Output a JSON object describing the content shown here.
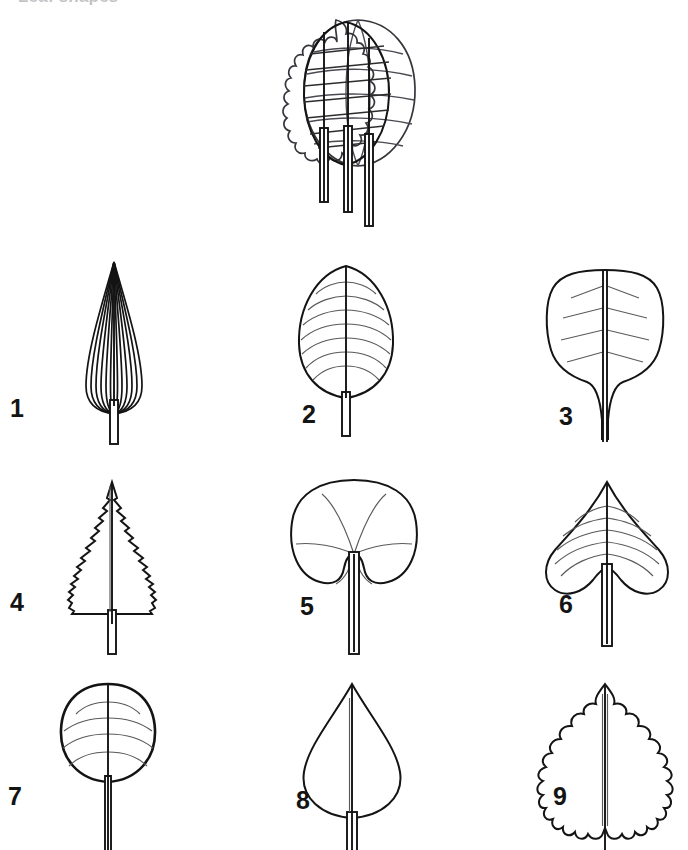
{
  "plate": {
    "title": "Leaf shapes",
    "background_color": "#ffffff",
    "ink_color": "#141414",
    "vein_color": "#5a5a5a",
    "width": 688,
    "height": 850,
    "style": "black-and-white line drawing",
    "columns": 3,
    "rows": 3
  },
  "composite": {
    "name": "composite-overlay-figure",
    "caption": "",
    "description": "Several leaf outlines superimposed one over another, showing a wavy-margined blade, an ovate pinnately-veined blade and a large rounded blade, with three petioles of differing length descending below.",
    "layer_count": 3,
    "petiole_count": 3
  },
  "specimens": [
    {
      "number": "1",
      "name": "leaf-1",
      "shape": "lanceolate-acuminate",
      "margin": "entire",
      "venation": "acrodromous",
      "vein_count": 12,
      "apex": "acuminate",
      "base": "attenuate"
    },
    {
      "number": "2",
      "name": "leaf-2",
      "shape": "ovate",
      "margin": "entire",
      "venation": "pinnate",
      "vein_count": 9,
      "apex": "acute",
      "base": "rounded"
    },
    {
      "number": "3",
      "name": "leaf-3",
      "shape": "obovate-spatulate",
      "margin": "entire",
      "venation": "pinnate",
      "vein_count": 5,
      "apex": "rounded",
      "base": "long-attenuate"
    },
    {
      "number": "4",
      "name": "leaf-4",
      "shape": "ovate",
      "margin": "serrate",
      "venation": "midrib only",
      "vein_count": 0,
      "apex": "acuminate",
      "base": "truncate"
    },
    {
      "number": "5",
      "name": "leaf-5",
      "shape": "orbicular-reniform",
      "margin": "entire",
      "venation": "palmate",
      "vein_count": 5,
      "apex": "rounded",
      "base": "deeply cordate"
    },
    {
      "number": "6",
      "name": "leaf-6",
      "shape": "cordate",
      "margin": "entire",
      "venation": "pinnate",
      "vein_count": 8,
      "apex": "acuminate",
      "base": "cordate"
    },
    {
      "number": "7",
      "name": "leaf-7",
      "shape": "orbicular",
      "margin": "entire",
      "venation": "pinnate",
      "vein_count": 6,
      "apex": "rounded",
      "base": "rounded"
    },
    {
      "number": "8",
      "name": "leaf-8",
      "shape": "obovate-deltoid",
      "margin": "entire",
      "venation": "midrib only",
      "vein_count": 0,
      "apex": "acuminate",
      "base": "rounded"
    },
    {
      "number": "9",
      "name": "leaf-9",
      "shape": "ovate",
      "margin": "sinuate-crenate",
      "venation": "midrib only",
      "vein_count": 0,
      "apex": "acute",
      "base": "rounded"
    }
  ]
}
